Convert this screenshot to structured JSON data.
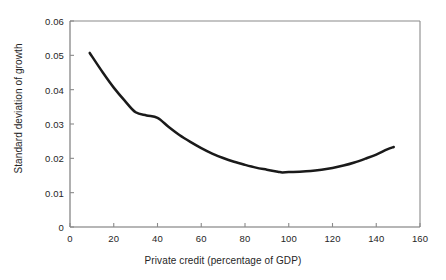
{
  "chart_data": {
    "type": "line",
    "title": "",
    "subtitle": "",
    "xlabel": "Private credit (percentage of GDP)",
    "ylabel": "Standard deviation of growth",
    "xlim": [
      0,
      160
    ],
    "ylim": [
      0,
      0.06
    ],
    "xticks": [
      0,
      20,
      40,
      60,
      80,
      100,
      120,
      140,
      160
    ],
    "yticks": [
      0,
      0.01,
      0.02,
      0.03,
      0.04,
      0.05,
      0.06
    ],
    "xtick_labels": [
      "0",
      "20",
      "40",
      "60",
      "80",
      "100",
      "120",
      "140",
      "160"
    ],
    "ytick_labels": [
      "0",
      "0.01",
      "0.02",
      "0.03",
      "0.04",
      "0.05",
      "0.06"
    ],
    "grid": false,
    "legend": null,
    "annotations": [],
    "line_color": "#1a1a1a",
    "line_width": 2.5,
    "frame_color": "#8a8a8a",
    "background_color": "#ffffff",
    "series": [
      {
        "name": "Standard deviation of growth",
        "x": [
          9,
          15,
          20,
          25,
          30,
          35,
          40,
          45,
          50,
          55,
          60,
          65,
          70,
          75,
          80,
          85,
          90,
          95,
          97,
          100,
          105,
          110,
          115,
          120,
          125,
          130,
          135,
          140,
          145,
          148
        ],
        "values": [
          0.0507,
          0.045,
          0.0406,
          0.0368,
          0.0334,
          0.0325,
          0.0318,
          0.0292,
          0.0268,
          0.0248,
          0.023,
          0.0214,
          0.0201,
          0.019,
          0.0181,
          0.0173,
          0.0167,
          0.0161,
          0.0159,
          0.016,
          0.0161,
          0.0163,
          0.0167,
          0.0172,
          0.0179,
          0.0188,
          0.0199,
          0.0211,
          0.0226,
          0.0233
        ]
      }
    ],
    "minimum_point": {
      "x": 97,
      "y": 0.0159
    },
    "start_point": {
      "x": 9,
      "y": 0.0507
    },
    "end_point": {
      "x": 148,
      "y": 0.0233
    }
  }
}
